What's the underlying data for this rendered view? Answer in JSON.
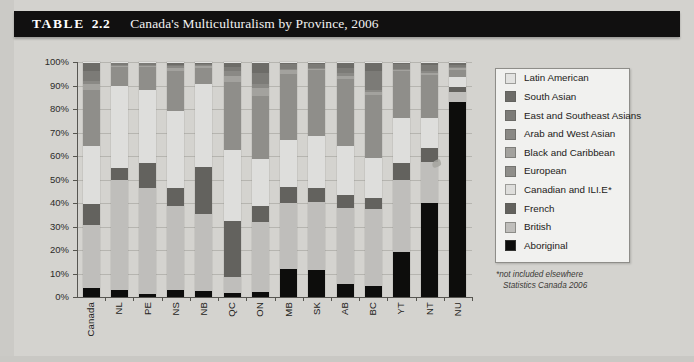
{
  "header": {
    "table_label": "TABLE",
    "table_number": "2.2",
    "title": "Canada's Multiculturalism by Province, 2006"
  },
  "legend": {
    "items": [
      {
        "label": "Latin American",
        "color": "#e3e3e1"
      },
      {
        "label": "South Asian",
        "color": "#6d6c68"
      },
      {
        "label": "East and Southeast Asians",
        "color": "#7c7b77"
      },
      {
        "label": "Arab and West Asian",
        "color": "#8a8985"
      },
      {
        "label": "Black and Caribbean",
        "color": "#a3a29e"
      },
      {
        "label": "European",
        "color": "#8f8e8a"
      },
      {
        "label": "Canadian and ILI.E*",
        "color": "#dededc"
      },
      {
        "label": "French",
        "color": "#63625e"
      },
      {
        "label": "British",
        "color": "#bfbebb"
      },
      {
        "label": "Aboriginal",
        "color": "#0d0d0c"
      }
    ],
    "note_line1": "*not included elsewhere",
    "note_line2": "Statistics Canada 2006"
  },
  "chart_data": {
    "type": "bar",
    "stacked": true,
    "title": "Canada's Multiculturalism by Province, 2006",
    "xlabel": "",
    "ylabel": "",
    "ylim": [
      0,
      100
    ],
    "ytick_labels": [
      "0%",
      "10%",
      "20%",
      "30%",
      "40%",
      "50%",
      "60%",
      "70%",
      "80%",
      "90%",
      "100%"
    ],
    "yticks": [
      0,
      10,
      20,
      30,
      40,
      50,
      60,
      70,
      80,
      90,
      100
    ],
    "grid": true,
    "legend_position": "right",
    "categories": [
      "Canada",
      "NL",
      "PE",
      "NS",
      "NB",
      "QC",
      "ON",
      "MB",
      "SK",
      "AB",
      "BC",
      "YT",
      "NT",
      "NU"
    ],
    "series": [
      {
        "name": "Aboriginal",
        "color": "#0d0d0c",
        "values": [
          4.0,
          3.0,
          1.5,
          3.0,
          2.5,
          1.5,
          2.0,
          12.0,
          11.5,
          5.5,
          4.5,
          19.0,
          40.0,
          78.0
        ]
      },
      {
        "name": "British",
        "color": "#bfbebb",
        "values": [
          27.0,
          47.0,
          45.0,
          36.0,
          33.0,
          7.0,
          30.0,
          28.0,
          29.0,
          33.0,
          33.0,
          31.0,
          17.0,
          4.0
        ]
      },
      {
        "name": "French",
        "color": "#63625e",
        "values": [
          9.0,
          5.0,
          11.0,
          8.0,
          20.0,
          24.0,
          7.0,
          7.0,
          6.0,
          6.0,
          5.0,
          7.0,
          6.0,
          2.0
        ]
      },
      {
        "name": "Canadian and ILI.E*",
        "color": "#dededc",
        "values": [
          25.0,
          35.0,
          31.0,
          33.0,
          35.0,
          30.0,
          20.0,
          20.0,
          22.0,
          21.0,
          17.0,
          19.0,
          13.0,
          4.0
        ]
      },
      {
        "name": "European",
        "color": "#8f8e8a",
        "values": [
          24.0,
          8.0,
          10.0,
          17.0,
          7.0,
          29.0,
          27.0,
          28.0,
          28.0,
          29.0,
          27.0,
          20.0,
          18.0,
          3.0
        ]
      },
      {
        "name": "Black and Caribbean",
        "color": "#a3a29e",
        "values": [
          2.5,
          0.5,
          0.5,
          1.5,
          0.6,
          2.5,
          3.5,
          1.5,
          0.6,
          1.5,
          1.0,
          0.6,
          1.0,
          0.6
        ]
      },
      {
        "name": "Arab and West Asian",
        "color": "#8a8985",
        "values": [
          1.5,
          0.4,
          0.4,
          0.6,
          0.5,
          2.0,
          1.5,
          0.6,
          0.5,
          1.2,
          1.0,
          0.5,
          0.6,
          0.4
        ]
      },
      {
        "name": "East and Southeast Asians",
        "color": "#7c7b77",
        "values": [
          4.0,
          0.6,
          0.6,
          0.8,
          0.6,
          2.0,
          5.0,
          2.0,
          1.4,
          2.3,
          8.0,
          2.0,
          2.5,
          1.0
        ]
      },
      {
        "name": "South Asian",
        "color": "#6d6c68",
        "values": [
          3.5,
          0.3,
          0.3,
          0.8,
          0.5,
          1.5,
          4.0,
          0.7,
          0.7,
          2.0,
          3.5,
          0.6,
          1.0,
          0.6
        ]
      },
      {
        "name": "Latin American",
        "color": "#e3e3e1",
        "values": [
          0.5,
          0.2,
          0.2,
          0.3,
          0.3,
          0.5,
          0.5,
          0.2,
          0.3,
          0.5,
          0.5,
          0.3,
          0.4,
          0.4
        ]
      }
    ]
  }
}
